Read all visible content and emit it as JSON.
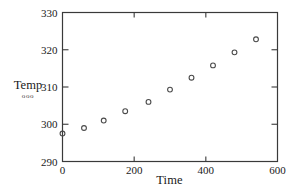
{
  "chart_data": {
    "type": "scatter",
    "title": "",
    "xlabel": "Time",
    "ylabel": "Temp",
    "xlim": [
      0,
      600
    ],
    "ylim": [
      290,
      330
    ],
    "xticks": [
      0,
      200,
      400,
      600
    ],
    "yticks": [
      290,
      300,
      310,
      320,
      330
    ],
    "xtick_labels": [
      "0",
      "200",
      "400",
      "600"
    ],
    "ytick_labels": [
      "290",
      "300",
      "310",
      "320",
      "330"
    ],
    "grid": false,
    "legend": null,
    "marker": "open-circle",
    "series": [
      {
        "name": "Temp",
        "x": [
          0,
          60,
          115,
          175,
          240,
          300,
          360,
          420,
          480,
          540
        ],
        "y": [
          297.5,
          299.0,
          301.0,
          303.5,
          306.0,
          309.3,
          312.5,
          315.8,
          319.3,
          322.8
        ]
      }
    ]
  },
  "axes": {
    "y_label": "Temp",
    "y_label_marks": "ooo",
    "x_label": "Time"
  },
  "colors": {
    "axis": "#3a3a3a",
    "marker": "#4a4a4a",
    "text": "#1a1a1a",
    "background": "#ffffff"
  }
}
